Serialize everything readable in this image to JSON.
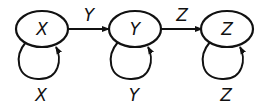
{
  "diagram": {
    "type": "state-transition",
    "states": [
      {
        "id": "X",
        "label": "X"
      },
      {
        "id": "Y",
        "label": "Y"
      },
      {
        "id": "Z",
        "label": "Z"
      }
    ],
    "transitions": [
      {
        "from": "X",
        "to": "Y",
        "label": "Y"
      },
      {
        "from": "Y",
        "to": "Z",
        "label": "Z"
      },
      {
        "from": "X",
        "to": "X",
        "label": "X"
      },
      {
        "from": "Y",
        "to": "Y",
        "label": "Y"
      },
      {
        "from": "Z",
        "to": "Z",
        "label": "Z"
      }
    ]
  }
}
